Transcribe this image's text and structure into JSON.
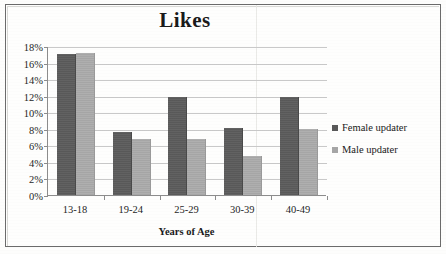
{
  "chart_data": {
    "type": "bar",
    "title": "Likes",
    "xlabel": "Years of Age",
    "ylabel": "",
    "categories": [
      "13-18",
      "19-24",
      "25-29",
      "30-39",
      "40-49"
    ],
    "series": [
      {
        "name": "Female updater",
        "color": "#595959",
        "values": [
          17.0,
          7.6,
          11.8,
          8.1,
          11.8
        ]
      },
      {
        "name": "Male updater",
        "color": "#a6a6a6",
        "values": [
          17.1,
          6.8,
          6.8,
          4.7,
          8.0
        ]
      }
    ],
    "ylim": [
      0,
      18
    ],
    "ytick_labels": [
      "0%",
      "2%",
      "4%",
      "6%",
      "8%",
      "10%",
      "12%",
      "14%",
      "16%",
      "18%"
    ],
    "ytick_values": [
      0,
      2,
      4,
      6,
      8,
      10,
      12,
      14,
      16,
      18
    ],
    "grid": true,
    "legend_position": "right"
  },
  "legend": {
    "items": [
      {
        "label": "Female updater"
      },
      {
        "label": "Male updater"
      }
    ]
  }
}
